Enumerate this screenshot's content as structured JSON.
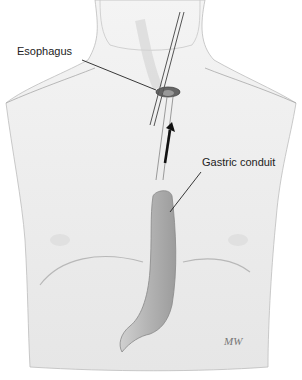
{
  "figure": {
    "labels": [
      {
        "id": "esophagus",
        "text": "Esophagus",
        "x": 17,
        "y": 52
      },
      {
        "id": "gastric-conduit",
        "text": "Gastric conduit",
        "x": 200,
        "y": 163
      }
    ],
    "signature": "MW",
    "colors": {
      "background": "#ffffff",
      "skin": "#ececec",
      "outline": "#9a9a9a",
      "conduit": "#b9b9b9",
      "leader_line": "#222222"
    }
  }
}
